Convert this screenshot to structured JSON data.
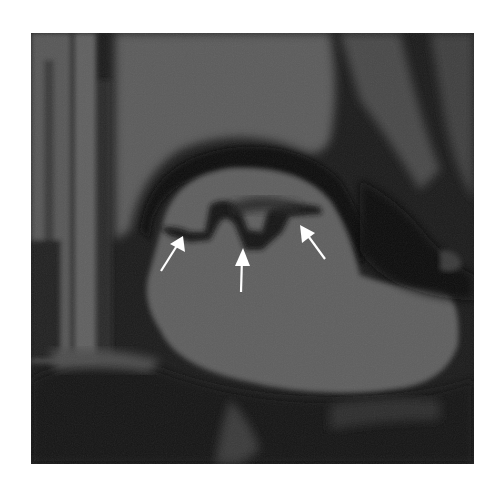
{
  "figure": {
    "modality": "MRI (grayscale)",
    "background": "#ffffff",
    "colors": {
      "dark": "#141414",
      "tissue": "#5a5a5a",
      "tissue_light": "#6e6e6e",
      "arrow": "#ffffff"
    },
    "arrows": [
      {
        "id": "left",
        "tip": [
          183,
          236
        ],
        "tail": [
          161,
          271
        ]
      },
      {
        "id": "center",
        "tip": [
          243,
          248
        ],
        "tail": [
          241,
          292
        ]
      },
      {
        "id": "right",
        "tip": [
          300,
          225
        ],
        "tail": [
          325,
          259
        ]
      }
    ]
  }
}
